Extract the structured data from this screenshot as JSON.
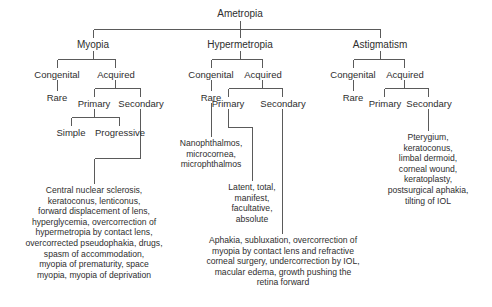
{
  "diagram": {
    "title": "Ametropia",
    "type": "classification-tree",
    "line_color": "#5a5a5a",
    "text_color": "#2e2e2e",
    "background_color": "#ffffff",
    "nodes": {
      "root": "Ametropia",
      "myopia": "Myopia",
      "hypermetropia": "Hypermetropia",
      "astigmatism": "Astigmatism",
      "myopia_congenital": "Congenital",
      "myopia_acquired": "Acquired",
      "myopia_rare": "Rare",
      "myopia_primary": "Primary",
      "myopia_secondary": "Secondary",
      "myopia_simple": "Simple",
      "myopia_progressive": "Progressive",
      "hyper_congenital": "Congenital",
      "hyper_acquired": "Acquired",
      "hyper_rare": "Rare",
      "hyper_primary": "Primary",
      "hyper_secondary": "Secondary",
      "astig_congenital": "Congenital",
      "astig_acquired": "Acquired",
      "astig_rare": "Rare",
      "astig_primary": "Primary",
      "astig_secondary": "Secondary"
    },
    "leaves": {
      "myopia_secondary_causes": "Central nuclear sclerosis,\nkeratoconus, lenticonus,\nforward displacement of lens,\nhyperglycemia, overcorrection of\nhypermetropia by contact lens,\novercorrected pseudophakia, drugs,\nspasm of accommodation,\nmyopia of prematurity, space\nmyopia, myopia of deprivation",
      "hyper_rare_causes": "Nanophthalmos,\nmicrocornea,\nmicrophthalmos",
      "hyper_primary_types": "Latent, total,\nmanifest,\nfacultative,\nabsolute",
      "hyper_secondary_causes": "Aphakia, subluxation, overcorrection of\nmyopia by contact lens and refractive\ncorneal surgery, undercorrection by IOL,\nmacular edema, growth pushing the\nretina forward",
      "astig_secondary_causes": "Pterygium,\nkeratoconus,\nlimbal dermoid,\ncorneal wound,\nkeratoplasty,\npostsurgical aphakia,\ntilting of IOL"
    }
  }
}
